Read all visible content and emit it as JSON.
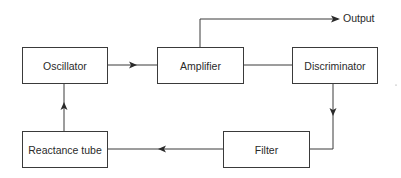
{
  "diagram": {
    "type": "block-diagram",
    "colors": {
      "line": "#3a3a3a",
      "text": "#2a2a2a",
      "background": "#ffffff"
    },
    "blocks": [
      {
        "id": "oscillator",
        "label": "Oscillator"
      },
      {
        "id": "amplifier",
        "label": "Amplifier"
      },
      {
        "id": "discriminator",
        "label": "Discriminator"
      },
      {
        "id": "reactance_tube",
        "label": "Reactance tube"
      },
      {
        "id": "filter",
        "label": "Filter"
      }
    ],
    "output_label": "Output",
    "connections": [
      {
        "from": "Oscillator",
        "to": "Amplifier"
      },
      {
        "from": "Amplifier",
        "to": "Output"
      },
      {
        "from": "Amplifier",
        "to": "Discriminator"
      },
      {
        "from": "Discriminator",
        "to": "Filter"
      },
      {
        "from": "Filter",
        "to": "Reactance tube"
      },
      {
        "from": "Reactance tube",
        "to": "Oscillator"
      }
    ]
  }
}
